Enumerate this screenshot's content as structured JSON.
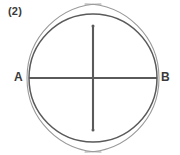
{
  "figure": {
    "step_label": "(2)",
    "point_a_label": "A",
    "point_b_label": "B",
    "colors": {
      "main_stroke": "#5a5a5a",
      "arc_stroke": "#9a9a9a",
      "diameter_stroke": "#5a5a5a",
      "bisector_stroke": "#5a5a5a",
      "label_color": "#3a3a3a",
      "background": "#ffffff"
    },
    "geometry": {
      "circle_center_x": 93,
      "circle_center_y": 78,
      "circle_radius": 64,
      "point_a_x": 29,
      "point_a_y": 78,
      "point_b_x": 157,
      "point_b_y": 78,
      "arc_radius": 74,
      "intersection_top_x": 93,
      "intersection_top_y": 26,
      "intersection_bottom_x": 93,
      "intersection_bottom_y": 130,
      "lens_left_x": 76,
      "lens_right_x": 110
    }
  }
}
